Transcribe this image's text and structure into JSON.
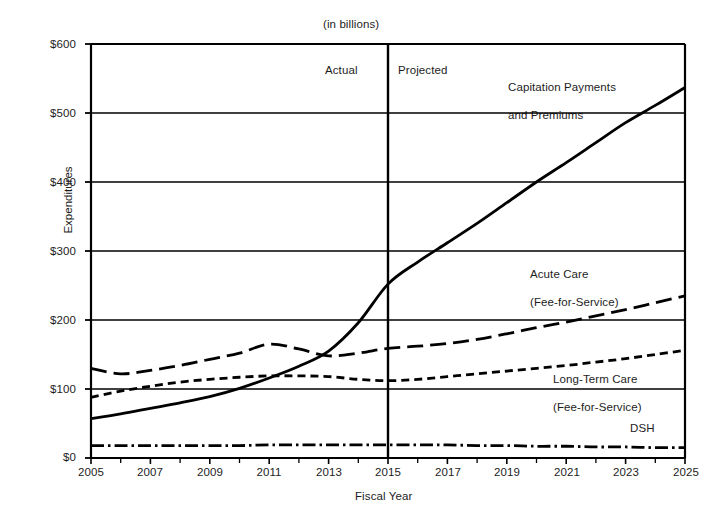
{
  "chart_data": {
    "type": "line",
    "title": "",
    "subtitle": "(in billions)",
    "xlabel": "Fiscal Year",
    "ylabel": "Expenditures",
    "xlim": [
      2005,
      2025
    ],
    "ylim": [
      0,
      600
    ],
    "grid": "horizontal-only",
    "legend_position": "inline-right-annotations",
    "y_tick_labels": [
      "$0",
      "$100",
      "$200",
      "$300",
      "$400",
      "$500",
      "$600"
    ],
    "y_ticks": [
      0,
      100,
      200,
      300,
      400,
      500,
      600
    ],
    "x_tick_labels": [
      "2005",
      "2007",
      "2009",
      "2011",
      "2013",
      "2015",
      "2017",
      "2019",
      "2021",
      "2023",
      "2025"
    ],
    "x_ticks": [
      2005,
      2007,
      2009,
      2011,
      2013,
      2015,
      2017,
      2019,
      2021,
      2023,
      2025
    ],
    "x_minor_ticks": [
      2006,
      2008,
      2010,
      2012,
      2014,
      2016,
      2018,
      2020,
      2022,
      2024
    ],
    "annotations": [
      {
        "name": "actual-label",
        "text": "Actual",
        "x": 2014.0,
        "y": 528
      },
      {
        "name": "projected-label",
        "text": "Projected",
        "x": 2015.5,
        "y": 528
      },
      {
        "name": "divider-line",
        "text": "",
        "x": 2015,
        "y": 0
      }
    ],
    "divider_year": 2015,
    "x": [
      2005,
      2006,
      2007,
      2008,
      2009,
      2010,
      2011,
      2012,
      2013,
      2014,
      2015,
      2016,
      2017,
      2018,
      2019,
      2020,
      2021,
      2022,
      2023,
      2024,
      2025
    ],
    "series": [
      {
        "name": "Capitation Payments and Premiums",
        "label_lines": [
          "Capitation Payments",
          "and Premiums"
        ],
        "style": "solid",
        "color": "#000000",
        "values": [
          57,
          64,
          72,
          80,
          89,
          101,
          116,
          133,
          155,
          196,
          252,
          284,
          312,
          340,
          370,
          400,
          428,
          457,
          486,
          511,
          537
        ]
      },
      {
        "name": "Acute Care (Fee-for-Service)",
        "label_lines": [
          "Acute Care",
          "(Fee-for-Service)"
        ],
        "style": "long-dash",
        "color": "#000000",
        "values": [
          130,
          122,
          127,
          134,
          143,
          152,
          165,
          158,
          148,
          152,
          159,
          162,
          166,
          172,
          180,
          189,
          197,
          206,
          215,
          225,
          235
        ]
      },
      {
        "name": "Long-Term Care (Fee-for-Service)",
        "label_lines": [
          "Long-Term Care",
          "(Fee-for-Service)"
        ],
        "style": "short-dash",
        "color": "#000000",
        "values": [
          88,
          97,
          104,
          110,
          114,
          117,
          119,
          119,
          118,
          114,
          112,
          114,
          118,
          122,
          126,
          130,
          134,
          139,
          144,
          150,
          156
        ]
      },
      {
        "name": "DSH",
        "label_lines": [
          "DSH"
        ],
        "style": "dash-dot",
        "color": "#000000",
        "values": [
          18,
          18,
          18,
          18,
          18,
          18,
          19,
          19,
          19,
          19,
          19,
          19,
          19,
          18,
          18,
          17,
          17,
          16,
          16,
          15,
          15
        ]
      }
    ]
  },
  "labels": {
    "subtitle": "(in billions)",
    "ylabel": "Expenditures",
    "xlabel": "Fiscal Year",
    "actual": "Actual",
    "projected": "Projected",
    "capitation_line1": "Capitation Payments",
    "capitation_line2": "and Premiums",
    "acute_line1": "Acute Care",
    "acute_line2": "(Fee-for-Service)",
    "ltc_line1": "Long-Term Care",
    "ltc_line2": "(Fee-for-Service)",
    "dsh": "DSH",
    "y0": "$0",
    "y100": "$100",
    "y200": "$200",
    "y300": "$300",
    "y400": "$400",
    "y500": "$500",
    "y600": "$600",
    "x2005": "2005",
    "x2007": "2007",
    "x2009": "2009",
    "x2011": "2011",
    "x2013": "2013",
    "x2015": "2015",
    "x2017": "2017",
    "x2019": "2019",
    "x2021": "2021",
    "x2023": "2023",
    "x2025": "2025"
  }
}
